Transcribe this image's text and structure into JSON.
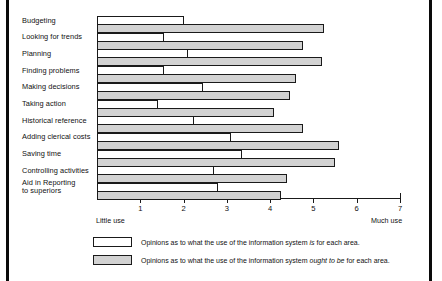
{
  "chart_data": {
    "type": "bar",
    "orientation": "horizontal",
    "title": "",
    "subtitle": "",
    "xlabel": "",
    "ylabel": "",
    "xlim": [
      0,
      7
    ],
    "grid": false,
    "axis_min_label": "Little use",
    "axis_max_label": "Much use",
    "tick_labels": [
      "1",
      "2",
      "3",
      "4",
      "5",
      "6",
      "7"
    ],
    "ticks": [
      1,
      2,
      3,
      4,
      5,
      6,
      7
    ],
    "categories": [
      "Budgeting",
      "Looking for trends",
      "Planning",
      "Finding problems",
      "Making decisions",
      "Taking action",
      "Historical reference",
      "Adding clerical costs",
      "Saving time",
      "Controlling activities",
      "Aid in Reporting to superiors"
    ],
    "series": [
      {
        "name": "is",
        "legend": "Opinions as to what the use of the information system is for each area.",
        "color": "#ffffff",
        "values": [
          2.0,
          1.55,
          2.1,
          1.55,
          2.45,
          1.4,
          2.25,
          3.1,
          3.35,
          2.7,
          2.8
        ]
      },
      {
        "name": "ought to be",
        "legend": "Opinions as to what the use of the information system ought to be for each area.",
        "color": "#d2d2d2",
        "values": [
          5.25,
          4.75,
          5.2,
          4.6,
          4.45,
          4.1,
          4.75,
          5.6,
          5.5,
          4.4,
          4.25
        ]
      }
    ],
    "legend_position": "bottom"
  },
  "legend": {
    "is_prefix": "Opinions as to what the use of the information system ",
    "is_emphasis": "is",
    "is_suffix": " for each area.",
    "ought_prefix": "Opinions as to what the use of the information system ",
    "ought_emphasis": "ought to be",
    "ought_suffix": " for each area."
  }
}
